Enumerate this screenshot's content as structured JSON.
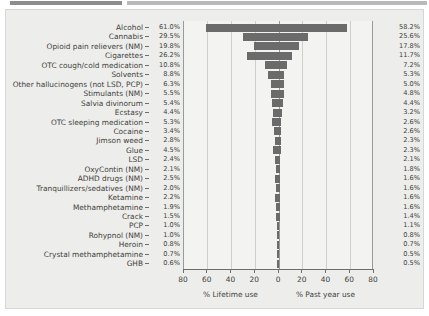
{
  "chart_data": {
    "type": "bar",
    "title": "",
    "subtitle": "",
    "orientation": "horizontal-diverging",
    "categories": [
      "Alcohol",
      "Cannabis",
      "Opioid pain relievers (NM)",
      "Cigarettes",
      "OTC cough/cold medication",
      "Solvents",
      "Other hallucinogens (not LSD, PCP)",
      "Stimulants (NM)",
      "Salvia divinorum",
      "Ecstasy",
      "OTC sleeping medication",
      "Cocaine",
      "Jimson weed",
      "Glue",
      "LSD",
      "OxyContin (NM)",
      "ADHD drugs (NM)",
      "Tranquillizers/sedatives (NM)",
      "Ketamine",
      "Methamphetamine",
      "Crack",
      "PCP",
      "Rohypnol (NM)",
      "Heroin",
      "Crystal methamphetamine",
      "GHB"
    ],
    "series": [
      {
        "name": "% Lifetime use",
        "side": "left",
        "values": [
          61.0,
          29.5,
          19.8,
          26.2,
          10.8,
          8.8,
          6.3,
          5.5,
          5.4,
          4.4,
          5.3,
          3.4,
          2.8,
          4.5,
          2.4,
          2.1,
          2.5,
          2.0,
          2.2,
          1.9,
          1.5,
          1.0,
          1.0,
          0.8,
          0.7,
          0.6
        ],
        "labels": [
          "61.0%",
          "29.5%",
          "19.8%",
          "26.2%",
          "10.8%",
          "8.8%",
          "6.3%",
          "5.5%",
          "5.4%",
          "4.4%",
          "5.3%",
          "3.4%",
          "2.8%",
          "4.5%",
          "2.4%",
          "2.1%",
          "2.5%",
          "2.0%",
          "2.2%",
          "1.9%",
          "1.5%",
          "1.0%",
          "1.0%",
          "0.8%",
          "0.7%",
          "0.6%"
        ]
      },
      {
        "name": "% Past year use",
        "side": "right",
        "values": [
          58.2,
          25.6,
          17.8,
          11.7,
          7.2,
          5.3,
          5.0,
          4.8,
          4.4,
          3.2,
          2.6,
          2.6,
          2.3,
          2.3,
          2.1,
          1.8,
          1.6,
          1.6,
          1.6,
          1.6,
          1.4,
          1.1,
          0.8,
          0.7,
          0.5,
          0.5
        ],
        "labels": [
          "58.2%",
          "25.6%",
          "17.8%",
          "11.7%",
          "7.2%",
          "5.3%",
          "5.0%",
          "4.8%",
          "4.4%",
          "3.2%",
          "2.6%",
          "2.6%",
          "2.3%",
          "2.3%",
          "2.1%",
          "1.8%",
          "1.6%",
          "1.6%",
          "1.6%",
          "1.6%",
          "1.4%",
          "1.1%",
          "0.8%",
          "0.7%",
          "0.5%",
          "0.5%"
        ]
      }
    ],
    "xlabel_left": "% Lifetime use",
    "xlabel_right": "% Past year use",
    "ylabel": "",
    "xlim_left": [
      0,
      80
    ],
    "xlim_right": [
      0,
      80
    ],
    "xticks_left": [
      "80",
      "60",
      "40",
      "20"
    ],
    "xticks_center": "0",
    "xticks_right": [
      "20",
      "40",
      "60",
      "80"
    ],
    "grid": true,
    "legend": "none",
    "bar_color": "#6b6b6b",
    "plot_background": "#f3f3f1",
    "panel_background": "#ededeb"
  }
}
